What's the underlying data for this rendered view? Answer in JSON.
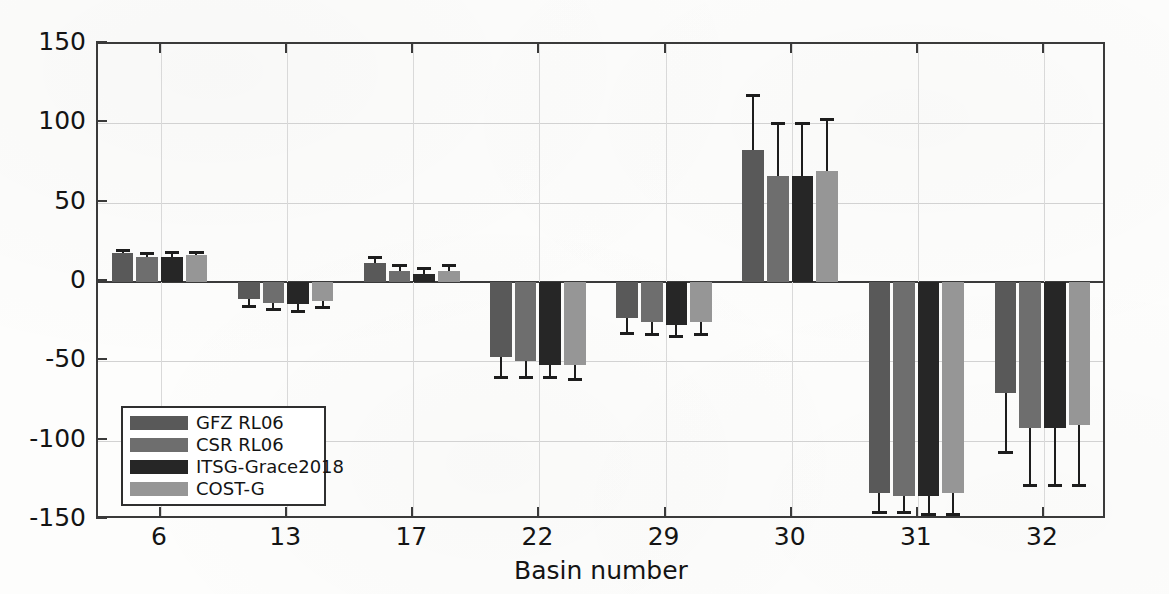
{
  "chart_data": {
    "type": "bar",
    "title": "",
    "subtitle": "",
    "xlabel": "Basin number",
    "ylabel": "Trend [Gt/a]",
    "categories": [
      "6",
      "13",
      "17",
      "22",
      "29",
      "30",
      "31",
      "32"
    ],
    "ylim": [
      -150,
      150
    ],
    "yticks": [
      -150,
      -100,
      -50,
      0,
      50,
      100,
      150
    ],
    "ytick_labels": [
      "-150",
      "-100",
      "-50",
      "0",
      "50",
      "100",
      "150"
    ],
    "grid": true,
    "grid_axis": "both",
    "legend_position": "lower-left-inside",
    "error_bars": "symmetric-capped",
    "series": [
      {
        "name": "GFZ RL06",
        "color": "#595959",
        "values": [
          18,
          -11,
          12,
          -47,
          -23,
          83,
          -133,
          -70
        ],
        "errors": [
          2,
          4,
          4,
          13,
          9,
          35,
          12,
          37
        ]
      },
      {
        "name": "CSR RL06",
        "color": "#6e6e6e",
        "values": [
          16,
          -13,
          7,
          -50,
          -25,
          67,
          -135,
          -92
        ],
        "errors": [
          2,
          4,
          4,
          10,
          8,
          33,
          10,
          36
        ]
      },
      {
        "name": "ITSG-Grace2018",
        "color": "#262626",
        "values": [
          16,
          -14,
          5,
          -52,
          -27,
          67,
          -135,
          -92
        ],
        "errors": [
          3,
          4,
          4,
          8,
          7,
          33,
          11,
          36
        ]
      },
      {
        "name": "COST-G",
        "color": "#969696",
        "values": [
          17,
          -12,
          7,
          -52,
          -25,
          70,
          -133,
          -90
        ],
        "errors": [
          2,
          4,
          4,
          9,
          8,
          33,
          13,
          38
        ]
      }
    ]
  },
  "axes": {
    "frame_color": "#3a3a3a",
    "grid_color": "#d2d2d2"
  },
  "legend": {
    "entries": [
      {
        "label": "GFZ RL06"
      },
      {
        "label": "CSR RL06"
      },
      {
        "label": "ITSG-Grace2018"
      },
      {
        "label": "COST-G"
      }
    ]
  }
}
